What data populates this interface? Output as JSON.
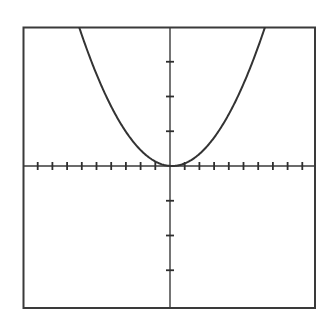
{
  "chart_data": {
    "type": "line",
    "title": "",
    "xlabel": "",
    "ylabel": "",
    "function": "y = 0.1x^2",
    "xlim": [
      -10,
      10
    ],
    "ylim": [
      -4,
      4
    ],
    "x_tick_step": 1,
    "y_tick_step": 1,
    "x_ticks": [
      -9,
      -8,
      -7,
      -6,
      -5,
      -4,
      -3,
      -2,
      -1,
      1,
      2,
      3,
      4,
      5,
      6,
      7,
      8,
      9
    ],
    "y_ticks": [
      -3,
      -2,
      -1,
      1,
      2,
      3
    ],
    "tick_labels_shown": false,
    "grid": false,
    "legend": null,
    "series": [
      {
        "name": "parabola",
        "shape": "upward-opening parabola, vertex at origin",
        "vertex": [
          0,
          0
        ],
        "coefficient": 0.1,
        "x": [
          -6.3,
          -5,
          -4,
          -3,
          -2,
          -1,
          0,
          1,
          2,
          3,
          4,
          5,
          6.3
        ],
        "y": [
          4.0,
          2.5,
          1.6,
          0.9,
          0.4,
          0.1,
          0,
          0.1,
          0.4,
          0.9,
          1.6,
          2.5,
          4.0
        ],
        "color": "#333333"
      }
    ]
  },
  "colors": {
    "background": "#ffffff",
    "frame": "#3a3a3a",
    "axis": "#3a3a3a",
    "curve": "#333333"
  }
}
